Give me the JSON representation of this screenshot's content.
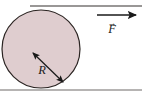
{
  "figure": {
    "kind": "physics-free-body-diagram",
    "background_color": "#ffffff"
  },
  "disk": {
    "name": "disk",
    "fill_color": "#dfcdcf",
    "stroke_color": "#2b2422",
    "center_x": 41,
    "center_y": 49,
    "radius": 39
  },
  "radius_arrow": {
    "name": "radius-dimension-arrow",
    "label": "R",
    "style": "double-headed",
    "color": "#1a1a1a",
    "from_x": 33,
    "from_y": 53,
    "to_x": 63,
    "to_y": 82,
    "label_x": 42,
    "label_y": 74
  },
  "force_arrow": {
    "name": "force-vector-arrow",
    "label": "F",
    "vector_notation": "→",
    "style": "single-headed",
    "color": "#1a1a1a",
    "from_x": 97,
    "from_y": 15,
    "to_x": 136,
    "to_y": 15,
    "label_x": 112,
    "label_y": 33,
    "bar_x": 112,
    "bar_y": 24
  },
  "top_line": {
    "name": "upper-horizontal-rule",
    "color": "#35302e",
    "x1": 30,
    "x2": 142,
    "y": 6
  },
  "ground_line": {
    "name": "ground-surface-line",
    "color": "#6e6a68",
    "x1": 0,
    "x2": 142,
    "y": 90
  }
}
